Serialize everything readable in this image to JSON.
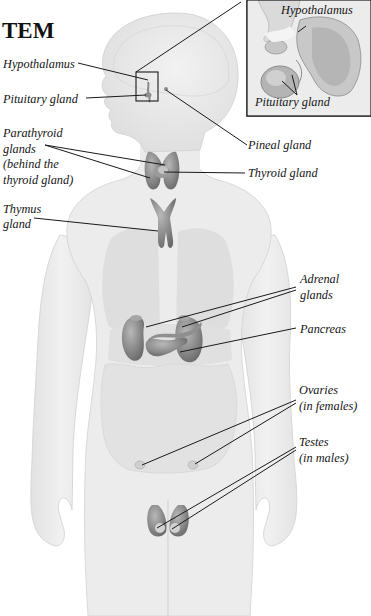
{
  "title": "TEM",
  "labels": {
    "hypothalamus": "Hypothalamus",
    "pituitary": "Pituitary gland",
    "pineal": "Pineal gland",
    "parathyroid": [
      "Parathyroid",
      "glands",
      "(behind the",
      "thyroid gland)"
    ],
    "thyroid": "Thyroid gland",
    "thymus": [
      "Thymus",
      "gland"
    ],
    "adrenal": [
      "Adrenal",
      "glands"
    ],
    "pancreas": "Pancreas",
    "ovaries": [
      "Ovaries",
      "(in females)"
    ],
    "testes": [
      "Testes",
      "(in males)"
    ]
  },
  "inset": {
    "hypothalamus": "Hypothalamus",
    "pituitary": "Pituitary gland"
  },
  "colors": {
    "body": "#ededed",
    "body_outline": "#d4d4d4",
    "organ_region": "#dcdcdc",
    "gland": "#8e8e8e",
    "gland_dark": "#6f6f6f",
    "leader_line": "#1a1a1a"
  }
}
